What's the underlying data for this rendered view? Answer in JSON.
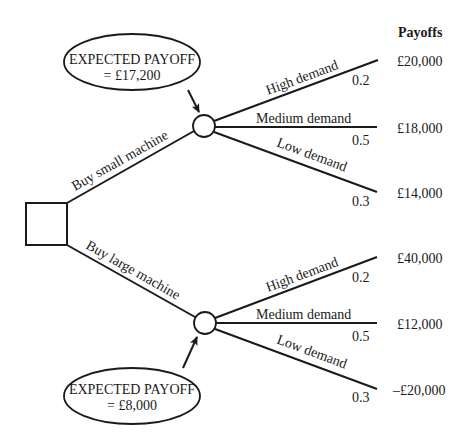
{
  "header": {
    "payoffs_label": "Payoffs"
  },
  "decision_node": {
    "shape": "square"
  },
  "options": [
    {
      "label": "Buy small machine",
      "expected_payoff_title": "EXPECTED PAYOFF",
      "expected_payoff_value": "= £17,200",
      "outcomes": [
        {
          "label": "High demand",
          "probability": "0.2",
          "payoff": "£20,000"
        },
        {
          "label": "Medium demand",
          "probability": "0.5",
          "payoff": "£18,000"
        },
        {
          "label": "Low demand",
          "probability": "0.3",
          "payoff": "£14,000"
        }
      ]
    },
    {
      "label": "Buy large machine",
      "expected_payoff_title": "EXPECTED PAYOFF",
      "expected_payoff_value": "= £8,000",
      "outcomes": [
        {
          "label": "High demand",
          "probability": "0.2",
          "payoff": "£40,000"
        },
        {
          "label": "Medium demand",
          "probability": "0.5",
          "payoff": "£12,000"
        },
        {
          "label": "Low demand",
          "probability": "0.3",
          "payoff": "–£20,000"
        }
      ]
    }
  ],
  "colors": {
    "ink": "#1a1a1a",
    "background": "#ffffff"
  }
}
